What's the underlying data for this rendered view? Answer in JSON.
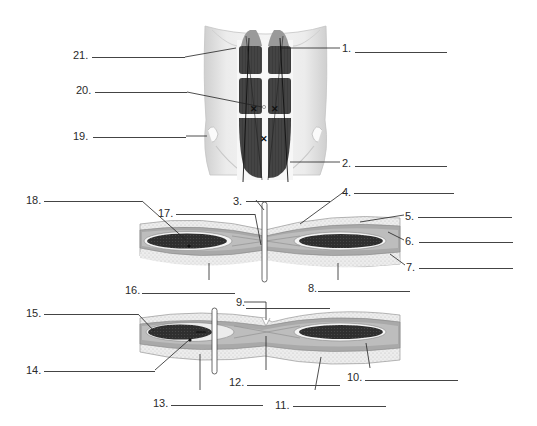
{
  "diagram": {
    "type": "anatomical-labeling-worksheet",
    "colors": {
      "muscle": "#3a3a3a",
      "muscle_light": "#5a5a5a",
      "skin": "#e6e6e6",
      "sheath_outer": "#d4d4d4",
      "sheath_inner": "#a8a8a8",
      "fat_stipple": "#ececec",
      "line": "#333333"
    }
  },
  "labels": [
    {
      "id": 1,
      "text": "1.",
      "x": 342,
      "y": 42,
      "blank_x": 355,
      "blank_w": 92
    },
    {
      "id": 2,
      "text": "2.",
      "x": 342,
      "y": 157,
      "blank_x": 355,
      "blank_w": 92
    },
    {
      "id": 3,
      "text": "3.",
      "x": 233,
      "y": 195,
      "blank_x": 246,
      "blank_w": 84
    },
    {
      "id": 4,
      "text": "4.",
      "x": 342,
      "y": 186,
      "blank_x": 354,
      "blank_w": 100
    },
    {
      "id": 5,
      "text": "5.",
      "x": 405,
      "y": 210,
      "blank_x": 418,
      "blank_w": 94
    },
    {
      "id": 6,
      "text": "6.",
      "x": 405,
      "y": 235,
      "blank_x": 419,
      "blank_w": 94
    },
    {
      "id": 7,
      "text": "7.",
      "x": 406,
      "y": 261,
      "blank_x": 419,
      "blank_w": 94
    },
    {
      "id": 8,
      "text": "8.",
      "x": 310,
      "y": 286,
      "blank_x": 318,
      "blank_w": 92
    },
    {
      "id": 9,
      "text": "9.",
      "x": 237,
      "y": 299,
      "blank_x": 246,
      "blank_w": 84
    },
    {
      "id": 10,
      "text": "10.",
      "x": 347,
      "y": 374,
      "blank_x": 365,
      "blank_w": 93
    },
    {
      "id": 11,
      "text": "11.",
      "x": 275,
      "y": 400,
      "blank_x": 293,
      "blank_w": 93
    },
    {
      "id": 12,
      "text": "12.",
      "x": 230,
      "y": 377,
      "blank_x": 247,
      "blank_w": 93
    },
    {
      "id": 13,
      "text": "13.",
      "x": 153,
      "y": 398,
      "blank_x": 171,
      "blank_w": 92
    },
    {
      "id": 14,
      "text": "14.",
      "x": 26,
      "y": 367,
      "blank_x": 44,
      "blank_w": 111
    },
    {
      "id": 15,
      "text": "15.",
      "x": 26,
      "y": 309,
      "blank_x": 44,
      "blank_w": 94
    },
    {
      "id": 16,
      "text": "16.",
      "x": 125,
      "y": 287,
      "blank_x": 142,
      "blank_w": 93
    },
    {
      "id": 17,
      "text": "17.",
      "x": 158,
      "y": 209,
      "blank_x": 176,
      "blank_w": 79
    },
    {
      "id": 18,
      "text": "18.",
      "x": 26,
      "y": 196,
      "blank_x": 44,
      "blank_w": 98
    },
    {
      "id": 19,
      "text": "19.",
      "x": 73,
      "y": 131,
      "blank_x": 93,
      "blank_w": 93
    },
    {
      "id": 20,
      "text": "20.",
      "x": 76,
      "y": 85,
      "blank_x": 95,
      "blank_w": 92
    },
    {
      "id": 21,
      "text": "21.",
      "x": 73,
      "y": 50,
      "blank_x": 92,
      "blank_w": 93
    }
  ]
}
